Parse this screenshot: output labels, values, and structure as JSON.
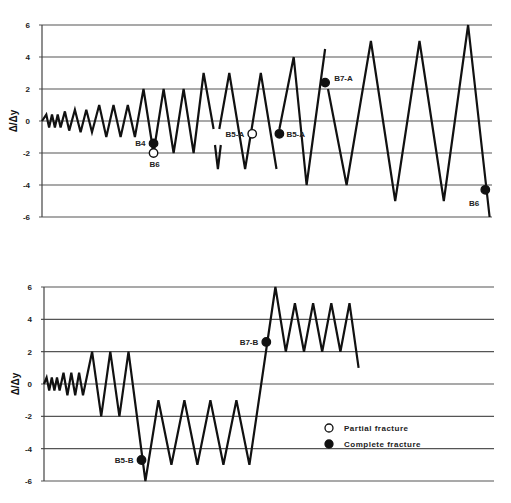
{
  "chart_data": [
    {
      "type": "line",
      "title": "",
      "xlabel": "",
      "ylabel": "Δ/Δy",
      "ylim": [
        -6,
        6
      ],
      "yticks": [
        "6",
        "4",
        "2",
        "0",
        "-2",
        "-4",
        "-6"
      ],
      "grid": true,
      "series": [
        {
          "name": "Loading history A",
          "points": [
            [
              0,
              0
            ],
            [
              3,
              0.4
            ],
            [
              5,
              -0.4
            ],
            [
              7,
              0.4
            ],
            [
              9,
              -0.4
            ],
            [
              11,
              0.4
            ],
            [
              13,
              -0.4
            ],
            [
              16,
              0.6
            ],
            [
              19,
              -0.6
            ],
            [
              23,
              0.7
            ],
            [
              27,
              -0.7
            ],
            [
              31,
              0.7
            ],
            [
              35,
              -0.7
            ],
            [
              40,
              1
            ],
            [
              45,
              -1
            ],
            [
              50,
              1
            ],
            [
              55,
              -1
            ],
            [
              60,
              1
            ],
            [
              65,
              -1
            ],
            [
              71,
              2
            ],
            [
              78,
              -2
            ],
            [
              85,
              2
            ],
            [
              92,
              -2
            ],
            [
              99,
              2
            ],
            [
              106,
              -2
            ],
            [
              113,
              3
            ],
            [
              120,
              -0.5
            ],
            [
              null,
              null
            ],
            [
              121,
              -1.5
            ],
            [
              123,
              -3
            ],
            [
              125,
              -1.5
            ],
            [
              null,
              null
            ],
            [
              124,
              -0.5
            ],
            [
              131,
              3
            ],
            [
              142,
              -3
            ],
            [
              153,
              3
            ],
            [
              164,
              -3
            ],
            [
              null,
              null
            ],
            [
              164,
              -1.5
            ],
            [
              null,
              null
            ],
            [
              166,
              -0.5
            ],
            [
              176,
              4
            ],
            [
              185,
              -4
            ],
            [
              198,
              4.5
            ],
            [
              null,
              null
            ],
            [
              200,
              2
            ],
            [
              213,
              -4
            ],
            [
              230,
              5
            ],
            [
              247,
              -5
            ],
            [
              264,
              5
            ],
            [
              281,
              -5
            ],
            [
              298,
              6
            ],
            [
              313,
              -6
            ]
          ]
        }
      ],
      "annotations": [
        {
          "label": "B4",
          "x": 78,
          "y": -1.4,
          "marker": "complete"
        },
        {
          "label": "B6",
          "x": 78,
          "y": -2,
          "marker": "partial"
        },
        {
          "label": "B5-A",
          "x": 147,
          "y": -0.8,
          "marker": "partial"
        },
        {
          "label": "B5-A",
          "x": 166,
          "y": -0.8,
          "marker": "complete"
        },
        {
          "label": "B7-A",
          "x": 198,
          "y": 2.4,
          "marker": "complete"
        },
        {
          "label": "B6",
          "x": 310,
          "y": -4.3,
          "marker": "complete"
        }
      ]
    },
    {
      "type": "line",
      "title": "",
      "xlabel": "",
      "ylabel": "Δ/Δy",
      "ylim": [
        -6,
        6
      ],
      "yticks": [
        "6",
        "4",
        "2",
        "0",
        "-2",
        "-4",
        "-6"
      ],
      "grid": true,
      "series": [
        {
          "name": "Loading history B",
          "points": [
            [
              0,
              0
            ],
            [
              2,
              0.4
            ],
            [
              4,
              -0.4
            ],
            [
              6,
              0.4
            ],
            [
              8,
              -0.4
            ],
            [
              10,
              0.4
            ],
            [
              12,
              -0.4
            ],
            [
              15,
              0.7
            ],
            [
              18,
              -0.7
            ],
            [
              21,
              0.7
            ],
            [
              24,
              -0.7
            ],
            [
              27,
              0.7
            ],
            [
              30,
              -0.7
            ],
            [
              37,
              2
            ],
            [
              44,
              -2
            ],
            [
              51,
              2
            ],
            [
              58,
              -2
            ],
            [
              65,
              2
            ],
            [
              78,
              -6
            ],
            [
              88,
              -1
            ],
            [
              98,
              -5
            ],
            [
              108,
              -1
            ],
            [
              118,
              -5
            ],
            [
              128,
              -1
            ],
            [
              138,
              -5
            ],
            [
              148,
              -1
            ],
            [
              158,
              -5
            ],
            [
              178,
              6
            ],
            [
              186,
              2
            ],
            [
              193,
              5
            ],
            [
              200,
              2
            ],
            [
              207,
              5
            ],
            [
              214,
              2
            ],
            [
              221,
              5
            ],
            [
              228,
              2
            ],
            [
              235,
              5
            ],
            [
              242,
              1
            ]
          ]
        }
      ],
      "annotations": [
        {
          "label": "B5-B",
          "x": 75,
          "y": -4.7,
          "marker": "complete"
        },
        {
          "label": "B7-B",
          "x": 171,
          "y": 2.6,
          "marker": "complete"
        }
      ]
    }
  ],
  "legend": {
    "items": [
      {
        "label": "Partial fracture",
        "marker": "open-circle"
      },
      {
        "label": "Complete fracture",
        "marker": "filled-circle"
      }
    ]
  },
  "layout": {
    "charts": [
      {
        "x0": 42,
        "x1": 492,
        "plot_x_scale": 1.43,
        "y_top": 25,
        "y_bottom": 217
      },
      {
        "x0": 44,
        "x1": 494,
        "plot_x_scale": 1.3,
        "y_top": 287,
        "y_bottom": 481
      }
    ]
  }
}
